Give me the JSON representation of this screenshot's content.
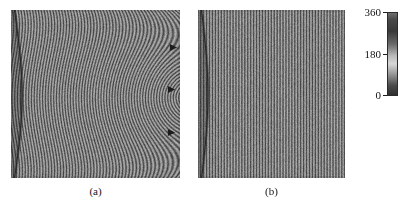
{
  "figure": {
    "kind": "interferogram-pair",
    "background_color": "#ffffff"
  },
  "panels": [
    {
      "id": "panel-a",
      "caption": "(a)",
      "x": 11,
      "y": 10,
      "width": 169,
      "height": 168,
      "pattern": "curved-concentric-fringes",
      "description": "Vertical interference fringes bent into concentric arcs centred at the right-hand edge",
      "fringe_count": 62,
      "arc_center_x_frac": 1.06,
      "arc_center_y_frac": 0.52,
      "markers": [
        {
          "label": "marker-upper",
          "x_frac": 0.965,
          "y_frac": 0.225
        },
        {
          "label": "marker-middle",
          "x_frac": 0.955,
          "y_frac": 0.475
        },
        {
          "label": "marker-lower",
          "x_frac": 0.955,
          "y_frac": 0.735
        }
      ]
    },
    {
      "id": "panel-b",
      "caption": "(b)",
      "x": 198,
      "y": 10,
      "width": 147,
      "height": 168,
      "pattern": "straight-vertical-fringes",
      "description": "Uniform straight vertical interference fringes",
      "fringe_count": 50,
      "arc_center_x_frac": null,
      "arc_center_y_frac": null,
      "markers": []
    }
  ],
  "colorbar": {
    "x": 387,
    "y": 12,
    "width": 11,
    "height": 84,
    "orientation": "vertical",
    "unit": "degrees",
    "min": 0,
    "max": 360,
    "ticks": [
      {
        "value": "360",
        "position_frac": 0.0
      },
      {
        "value": "180",
        "position_frac": 0.5
      },
      {
        "value": "0",
        "position_frac": 1.0
      }
    ],
    "colormap": "grayscale-phase",
    "stops": [
      {
        "pos": 0.0,
        "color": "#6f6f6f"
      },
      {
        "pos": 0.08,
        "color": "#4a4a4a"
      },
      {
        "pos": 0.22,
        "color": "#3a3a3a"
      },
      {
        "pos": 0.38,
        "color": "#6a6a6a"
      },
      {
        "pos": 0.52,
        "color": "#b9b9b9"
      },
      {
        "pos": 0.62,
        "color": "#d8d8d8"
      },
      {
        "pos": 0.74,
        "color": "#9a9a9a"
      },
      {
        "pos": 0.88,
        "color": "#4d4d4d"
      },
      {
        "pos": 1.0,
        "color": "#2f2f2f"
      }
    ]
  },
  "colors": {
    "ink": "#121212",
    "panel_base": "#7a7a7a",
    "fringe_dark": "#4b4b4b",
    "fringe_light": "#a7a7a7",
    "edge_line": "#2e2e2e",
    "paper": "#ffffff"
  }
}
